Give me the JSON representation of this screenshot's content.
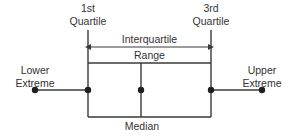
{
  "diagram": {
    "type": "box-plot-annotated",
    "background_color": "#ffffff",
    "line_color": "#3a3a3a",
    "text_color": "#333333",
    "labels": {
      "first_quartile_line1": "1st",
      "first_quartile_line2": "Quartile",
      "third_quartile_line1": "3rd",
      "third_quartile_line2": "Quartile",
      "interquartile_line1": "Interquartile",
      "interquartile_line2": "Range",
      "lower_extreme_line1": "Lower",
      "lower_extreme_line2": "Extreme",
      "upper_extreme_line1": "Upper",
      "upper_extreme_line2": "Extreme",
      "median": "Median"
    },
    "geometry": {
      "lower_extreme_x": 35,
      "first_quartile_x": 88,
      "median_x": 141,
      "third_quartile_x": 211,
      "upper_extreme_x": 262,
      "whisker_y": 90,
      "box_top_y": 63,
      "box_bottom_y": 117,
      "quartile_line_top_y": 30,
      "iqr_arrow_y": 47
    }
  }
}
